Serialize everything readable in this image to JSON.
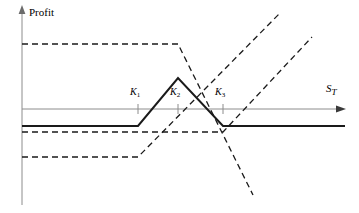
{
  "figure": {
    "y_axis_label": "Profit",
    "x_axis_label_main": "S",
    "x_axis_label_sub": "T",
    "strikes": [
      {
        "name": "K",
        "sub": "1",
        "x": 138
      },
      {
        "name": "K",
        "sub": "2",
        "x": 178
      },
      {
        "name": "K",
        "sub": "3",
        "x": 223
      }
    ],
    "colors": {
      "axis": "#8c8c8c",
      "payoff_solid": "#1a1a1a",
      "payoff_dashed": "#1a1a1a",
      "background": "#ffffff"
    }
  },
  "chart_data": {
    "type": "line",
    "title": "",
    "subtitle": "",
    "xlabel": "S_T",
    "ylabel": "Profit",
    "grid": false,
    "legend": null,
    "axis_origin": {
      "x": 22,
      "y": 109
    },
    "xlim": [
      22,
      345
    ],
    "ylim_pixels": [
      5,
      205
    ],
    "x_ticks": [
      {
        "label": "K1",
        "x": 138
      },
      {
        "label": "K2",
        "x": 178
      },
      {
        "label": "K3",
        "x": 223
      }
    ],
    "series": [
      {
        "name": "butterfly-spread-net-profit",
        "style": "solid",
        "color": "#1a1a1a",
        "points": [
          {
            "x": 22,
            "y": 126
          },
          {
            "x": 138,
            "y": 126
          },
          {
            "x": 178,
            "y": 78
          },
          {
            "x": 223,
            "y": 126
          },
          {
            "x": 345,
            "y": 126
          }
        ]
      },
      {
        "name": "long-call-K1",
        "style": "dashed",
        "color": "#1a1a1a",
        "points": [
          {
            "x": 22,
            "y": 157
          },
          {
            "x": 138,
            "y": 157
          },
          {
            "x": 280,
            "y": 13
          }
        ]
      },
      {
        "name": "long-call-K3",
        "style": "dashed",
        "color": "#1a1a1a",
        "points": [
          {
            "x": 22,
            "y": 132
          },
          {
            "x": 223,
            "y": 132
          },
          {
            "x": 312,
            "y": 37
          }
        ]
      },
      {
        "name": "short-two-calls-K2",
        "style": "dashed",
        "color": "#1a1a1a",
        "points": [
          {
            "x": 22,
            "y": 44
          },
          {
            "x": 178,
            "y": 44
          },
          {
            "x": 253,
            "y": 195
          }
        ]
      }
    ]
  }
}
